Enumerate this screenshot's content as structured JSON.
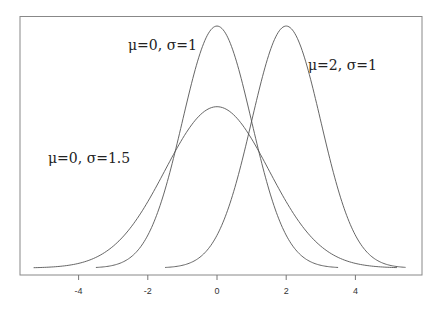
{
  "chart_data": {
    "type": "line",
    "title": "",
    "xlabel": "",
    "ylabel": "",
    "xlim": [
      -5.6,
      5.85
    ],
    "ylim": [
      0,
      0.41
    ],
    "grid": false,
    "legend": "inline labels",
    "x_ticks": [
      -4,
      -2,
      0,
      2,
      4
    ],
    "x_tick_labels": [
      "-4",
      "-2",
      "0",
      "2",
      "4"
    ],
    "series": [
      {
        "name": "μ=0, σ=1",
        "mu": 0,
        "sigma": 1,
        "x_range": [
          -3.5,
          3.5
        ],
        "peak": 0.399
      },
      {
        "name": "μ=2, σ=1",
        "mu": 2,
        "sigma": 1,
        "x_range": [
          -1.5,
          5.45
        ],
        "peak": 0.399
      },
      {
        "name": "μ=0, σ=1.5",
        "mu": 0,
        "sigma": 1.5,
        "x_range": [
          -5.3,
          5.2
        ],
        "peak": 0.266
      }
    ],
    "annotations": [
      {
        "text": "μ=0, σ=1",
        "x": 128,
        "y": 50
      },
      {
        "text": "μ=2, σ=1",
        "x": 308,
        "y": 70
      },
      {
        "text": "μ=0, σ=1.5",
        "x": 48,
        "y": 163
      }
    ]
  },
  "colors": {
    "curve": "#555555",
    "axis": "#777777"
  }
}
